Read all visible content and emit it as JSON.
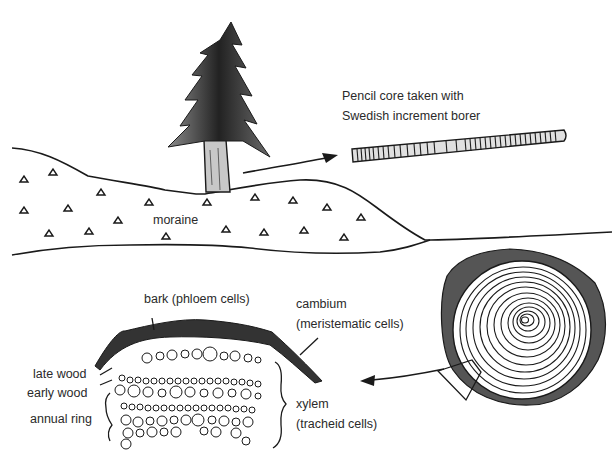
{
  "diagram": {
    "type": "scientific illustration",
    "labels": {
      "core_line1": "Pencil core taken with",
      "core_line2": "Swedish increment borer",
      "moraine": "moraine",
      "bark": "bark (phloem cells)",
      "cambium_line1": "cambium",
      "cambium_line2": "(meristematic cells)",
      "late_wood": "late wood",
      "early_wood": "early wood",
      "annual_ring": "annual ring",
      "xylem_line1": "xylem",
      "xylem_line2": "(tracheid cells)"
    },
    "components": [
      {
        "id": "tree",
        "description": "conifer tree standing on moraine hill"
      },
      {
        "id": "moraine",
        "description": "hill with triangular stone symbols"
      },
      {
        "id": "pencil-core",
        "description": "banded wood core sample"
      },
      {
        "id": "trunk-cross-section",
        "description": "concentric annual rings with bark, wedge marked"
      },
      {
        "id": "wedge-detail",
        "description": "magnified cellular wedge showing bark, cambium, xylem"
      }
    ],
    "arrows": [
      {
        "from": "tree",
        "to": "pencil-core"
      },
      {
        "from": "trunk-cross-section",
        "to": "wedge-detail"
      }
    ],
    "colors": {
      "ink": "#1a1a1a",
      "bark": "#3a3a3a",
      "trunk": "#c8c8c8",
      "core_fill": "#d8d8d8"
    }
  }
}
